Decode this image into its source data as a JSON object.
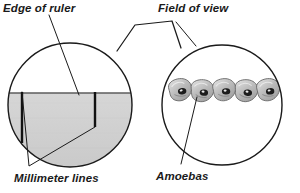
{
  "figure": {
    "title_labels": {
      "edge_of_ruler": "Edge of ruler",
      "field_of_view": "Field of view",
      "millimeter_lines": "Millimeter lines",
      "amoebas": "Amoebas"
    },
    "colors": {
      "background": "#ffffff",
      "stroke": "#1a1a1a",
      "ruler_gray": "#c9c9c9",
      "ruler_gray_light": "#d6d6d6",
      "tick_black": "#111111",
      "amoeba_fill": "#b9b9b9",
      "amoeba_fill_light": "#d2d2d2",
      "amoeba_nucleus": "#1c1c1c",
      "text": "#1a1a1a"
    },
    "left_circle": {
      "name": "ruler-view-circle",
      "cx": 70,
      "cy": 105,
      "r": 62,
      "ruler_edge_y": 93,
      "millimeter_line_count": 2,
      "millimeter_line_x": [
        22,
        95
      ]
    },
    "right_circle": {
      "name": "field-of-view-circle",
      "cx": 222,
      "cy": 105,
      "r": 60,
      "amoeba_count": 5,
      "amoeba_positions": [
        {
          "x": 180,
          "y": 90
        },
        {
          "x": 202,
          "y": 91
        },
        {
          "x": 224,
          "y": 90
        },
        {
          "x": 246,
          "y": 91
        },
        {
          "x": 268,
          "y": 90
        }
      ]
    },
    "magnification_cone": {
      "name": "magnification-cone",
      "points": "117,51 135,25 172,21 181,48"
    },
    "leaders": {
      "edge_of_ruler": "49,15 79,95",
      "field_of_view": "176,22 196,46",
      "millimeter_lines_a": "22,92 29,166",
      "millimeter_lines_b": "95,126 29,166",
      "amoebas": "197,97 181,164"
    }
  }
}
